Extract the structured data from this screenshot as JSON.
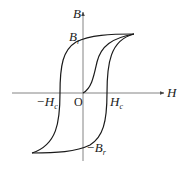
{
  "diagram": {
    "axes": {
      "x_label": "H",
      "y_label": "B",
      "origin_label": "O"
    },
    "labels": {
      "remanence_pos": {
        "main": "B",
        "sub": "r"
      },
      "remanence_neg": {
        "prefix": "−",
        "main": "B",
        "sub": "r"
      },
      "coercivity_pos": {
        "main": "H",
        "sub": "c"
      },
      "coercivity_neg": {
        "prefix": "−",
        "main": "H",
        "sub": "c"
      }
    },
    "colors": {
      "curve": "#1a1a1a",
      "axis": "#555555",
      "background": "#ffffff"
    }
  }
}
